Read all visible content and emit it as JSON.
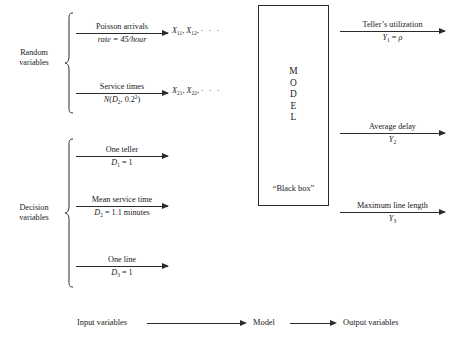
{
  "diagram": {
    "groups": [
      {
        "name": "random-variables",
        "label": "Random\nvariables",
        "flows": [
          {
            "id": "poisson-arrivals",
            "label_top": "Poisson arrivals",
            "label_bottom": "rate = 45/hour",
            "output_token": "X11, X12, ⋯"
          },
          {
            "id": "service-times",
            "label_top": "Service times",
            "label_bottom": "N(D2, 0.2²)",
            "output_token": "X21, X22, ⋯"
          }
        ]
      },
      {
        "name": "decision-variables",
        "label": "Decision\nvariables",
        "flows": [
          {
            "id": "one-teller",
            "label_top": "One teller",
            "label_bottom": "D1 = 1",
            "output_token": ""
          },
          {
            "id": "mean-service-time",
            "label_top": "Mean service time",
            "label_bottom": "D2 = 1.1 minutes",
            "output_token": ""
          },
          {
            "id": "one-line",
            "label_top": "One line",
            "label_bottom": "D3 = 1",
            "output_token": ""
          }
        ]
      }
    ],
    "model": {
      "letters": [
        "M",
        "O",
        "D",
        "E",
        "L"
      ],
      "caption": "“Black box”"
    },
    "outputs": [
      {
        "id": "tellers-utilization",
        "label_top": "Teller’s utilization",
        "label_bottom": "Y1 = ρ"
      },
      {
        "id": "average-delay",
        "label_top": "Average delay",
        "label_bottom": "Y2"
      },
      {
        "id": "maximum-line-length",
        "label_top": "Maximum line length",
        "label_bottom": "Y3"
      }
    ],
    "legend": {
      "input_label": "Input variables",
      "model_label": "Model",
      "output_label": "Output variables"
    },
    "colors": {
      "ink": "#1a1a1a",
      "line": "#2b2b2b",
      "background": "#ffffff"
    }
  }
}
